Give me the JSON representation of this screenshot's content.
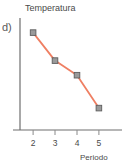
{
  "figure": {
    "item_label": "d)",
    "background_color": "#ffffff"
  },
  "chart_data": {
    "type": "line",
    "title": "",
    "xlabel": "Periodo",
    "ylabel": "Temperatura",
    "x": [
      2,
      3,
      4,
      5
    ],
    "categories": [
      "2",
      "3",
      "4",
      "5"
    ],
    "tick_labels_x": [
      "2",
      "3",
      "4",
      "5"
    ],
    "tick_labels_y": [],
    "values": [
      4.0,
      2.85,
      2.25,
      0.9
    ],
    "series": [
      {
        "name": "Temperatura",
        "values": [
          4.0,
          2.85,
          2.25,
          0.9
        ],
        "line_color": "#ef7f63",
        "marker_color": "#7b7b7b",
        "marker_shape": "square"
      }
    ],
    "xlim": [
      1.4,
      5.6
    ],
    "ylim": [
      0,
      4.6
    ],
    "grid": false,
    "legend": false,
    "axis_color": "#6e6e6e",
    "trend": "decreasing"
  },
  "axes": {
    "y_title": "Temperatura",
    "x_title": "Periodo"
  }
}
